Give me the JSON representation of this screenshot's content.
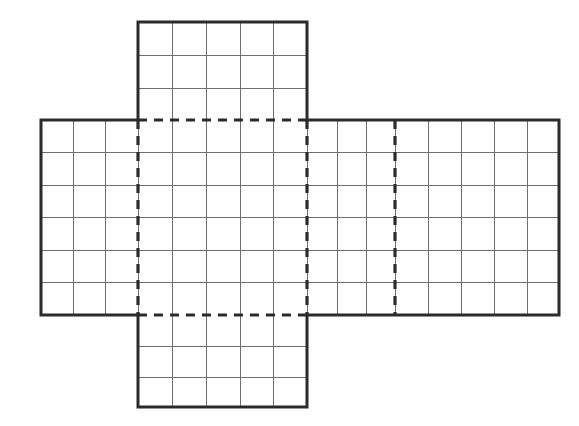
{
  "figure": {
    "canvas": {
      "width": 579,
      "height": 426
    },
    "colors": {
      "background": "#ffffff",
      "outline": "#2b2b2b",
      "grid": "#6f6f6f",
      "fold": "#2b2b2b"
    }
  },
  "chart_data": {
    "type": "diagram",
    "grid": {
      "cell_width_px": 32.8,
      "cell_height_px": 32.6,
      "grid_on": true
    },
    "geometry": {
      "horizontal_band": {
        "x1": 41,
        "y1": 120,
        "x2": 559,
        "y2": 315
      },
      "top_flap": {
        "x1": 138,
        "y1": 22,
        "x2": 307,
        "y2": 120
      },
      "bottom_flap": {
        "x1": 138,
        "y1": 315,
        "x2": 307,
        "y2": 407
      }
    },
    "columns": {
      "left_panel": 3,
      "center_panel": 5,
      "right_panel_near": 3,
      "right_panel_far": 5,
      "total_horizontal": 16
    },
    "rows": {
      "horizontal_band": 6,
      "top_flap": 3,
      "bottom_flap": 3
    },
    "vertical_grid_x": [
      41,
      73,
      105,
      138,
      172,
      206,
      240,
      273,
      307,
      337,
      366,
      395,
      428,
      461,
      494,
      527,
      559
    ],
    "horizontal_grid_y": [
      120,
      152,
      185,
      217,
      250,
      282,
      315
    ],
    "top_flap_grid_y": [
      22,
      55,
      88,
      120
    ],
    "bottom_flap_grid_y": [
      315,
      346,
      377,
      407
    ],
    "top_flap_grid_x": [
      138,
      172,
      206,
      240,
      273,
      307
    ],
    "fold_lines": [
      {
        "name": "top-fold",
        "orientation": "horizontal",
        "x1": 138,
        "y1": 120,
        "x2": 307,
        "y2": 120
      },
      {
        "name": "bottom-fold",
        "orientation": "horizontal",
        "x1": 138,
        "y1": 315,
        "x2": 307,
        "y2": 315
      },
      {
        "name": "left-fold",
        "orientation": "vertical",
        "x1": 138,
        "y1": 120,
        "x2": 138,
        "y2": 315
      },
      {
        "name": "center-right-fold",
        "orientation": "vertical",
        "x1": 307,
        "y1": 120,
        "x2": 307,
        "y2": 315
      },
      {
        "name": "far-right-fold",
        "orientation": "vertical",
        "x1": 395,
        "y1": 120,
        "x2": 395,
        "y2": 315
      }
    ],
    "faces": [
      {
        "name": "top-face",
        "label": "",
        "cols": 5,
        "rows": 3
      },
      {
        "name": "left-face",
        "label": "",
        "cols": 3,
        "rows": 6
      },
      {
        "name": "center-face",
        "label": "",
        "cols": 5,
        "rows": 6
      },
      {
        "name": "right-face",
        "label": "",
        "cols": 3,
        "rows": 6
      },
      {
        "name": "far-right-face",
        "label": "",
        "cols": 5,
        "rows": 6
      },
      {
        "name": "bottom-face",
        "label": "",
        "cols": 5,
        "rows": 3
      }
    ],
    "xlabel": "",
    "ylabel": "",
    "legend": []
  }
}
